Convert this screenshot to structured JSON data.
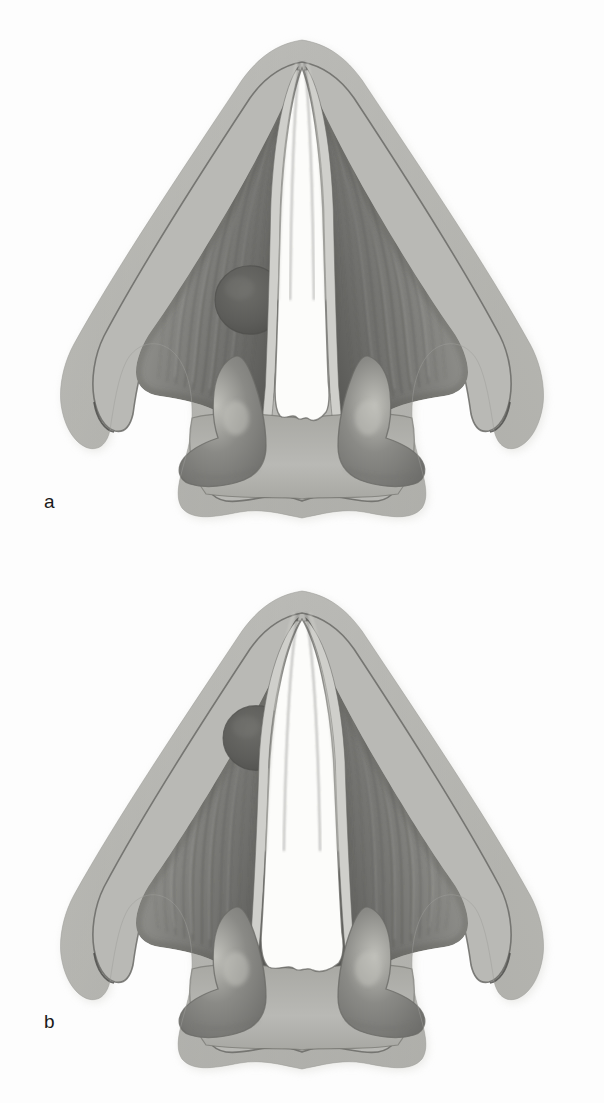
{
  "figure": {
    "background_color": "#fdfdfd",
    "width": 604,
    "height": 1103,
    "illustration_type": "anatomical-line-and-tone-illustration"
  },
  "palette": {
    "background": "#fdfdfd",
    "cartilage_light": "#b9b9b5",
    "cartilage_mid": "#a8a8a3",
    "cartilage_highlight": "#c9c9c4",
    "muscle_base": "#8e8e8a",
    "muscle_dark": "#6f6f6c",
    "muscle_darkest": "#575754",
    "muscle_light": "#9f9f9b",
    "fold_edge_light": "#cfcfcb",
    "airway_white": "#fcfcfa",
    "mass_fill": "#5d5d5a",
    "mass_edge": "#4e4e4b",
    "arytenoid_body": "#8a8a86",
    "arytenoid_highlight": "#c0c0ba",
    "outline_stroke": "#6a6a66",
    "label_text": "#1a1a1a"
  },
  "panels": [
    {
      "id": "a",
      "label": "a",
      "label_position": {
        "x": 44,
        "y": 492
      },
      "caption_letter": "a",
      "glottis_state": "narrow-adducted",
      "glottis_width_px": 46,
      "mass": {
        "name": "lateral-submucosal-mass",
        "side": "left",
        "center": {
          "x": 250,
          "y": 300
        },
        "radius": 35,
        "fill": "#5d5d5a"
      },
      "structures": [
        "epiglottis-thyroid-lamina-wing-left",
        "epiglottis-thyroid-lamina-wing-right",
        "thyroarytenoid-muscle-left",
        "thyroarytenoid-muscle-right",
        "vocal-fold-edge-left",
        "vocal-fold-edge-right",
        "glottic-airway",
        "arytenoid-cartilage-left",
        "arytenoid-cartilage-right",
        "pyriform-sinus-notch-left",
        "pyriform-sinus-notch-right",
        "posterior-cricoid-plate"
      ]
    },
    {
      "id": "b",
      "label": "b",
      "label_position": {
        "x": 44,
        "y": 1012
      },
      "caption_letter": "b",
      "glottis_state": "wide-abducted",
      "glottis_width_px": 70,
      "mass": {
        "name": "lateral-submucosal-mass",
        "side": "left",
        "center": {
          "x": 256,
          "y": 187
        },
        "radius": 33,
        "fill": "#5d5d5a"
      },
      "structures": [
        "epiglottis-thyroid-lamina-wing-left",
        "epiglottis-thyroid-lamina-wing-right",
        "thyroarytenoid-muscle-left",
        "thyroarytenoid-muscle-right",
        "vocal-fold-edge-left",
        "vocal-fold-edge-right",
        "glottic-airway",
        "arytenoid-cartilage-left",
        "arytenoid-cartilage-right",
        "pyriform-sinus-notch-left",
        "pyriform-sinus-notch-right",
        "posterior-cricoid-plate"
      ]
    }
  ],
  "geometry": {
    "apex_y": 46,
    "wing_tip_left": {
      "x": 68,
      "y": 452
    },
    "wing_tip_right": {
      "x": 536,
      "y": 452
    },
    "base_y": 520,
    "center_x": 302,
    "muscle_fiber_count": 11
  }
}
